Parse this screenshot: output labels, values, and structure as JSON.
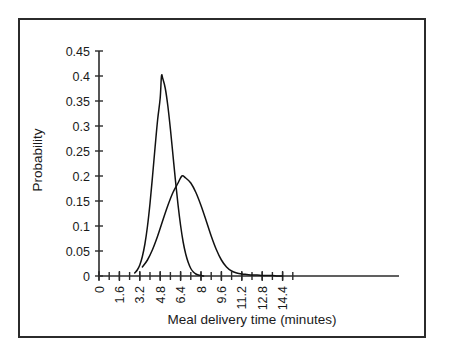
{
  "chart_data": {
    "type": "line",
    "title": "",
    "xlabel": "Meal delivery time (minutes)",
    "ylabel": "Probability",
    "xlim": [
      0,
      15.2
    ],
    "ylim": [
      0,
      0.45
    ],
    "grid": false,
    "legend": "none",
    "x_tick_labels": [
      "0",
      "1.6",
      "3.2",
      "4.8",
      "6.4",
      "8",
      "9.6",
      "11.2",
      "12.8",
      "14.4"
    ],
    "x_tick_values": [
      0,
      1.6,
      3.2,
      4.8,
      6.4,
      8,
      9.6,
      11.2,
      12.8,
      14.4
    ],
    "x_minor_step": 0.8,
    "y_tick_labels": [
      "0",
      "0.05",
      "0.1",
      "0.15",
      "0.2",
      "0.25",
      "0.3",
      "0.35",
      "0.4",
      "0.45"
    ],
    "y_tick_values": [
      0,
      0.05,
      0.1,
      0.15,
      0.2,
      0.25,
      0.3,
      0.35,
      0.4,
      0.45
    ],
    "series": [
      {
        "name": "narrow-distribution",
        "peak_x": 4.9,
        "peak_y": 0.4,
        "mean": 4.9,
        "std": 1.0,
        "x": [
          2.8,
          3.0,
          3.2,
          3.4,
          3.6,
          3.8,
          4.0,
          4.2,
          4.4,
          4.6,
          4.8,
          4.9,
          5.0,
          5.2,
          5.4,
          5.6,
          5.8,
          6.0,
          6.2,
          6.4,
          6.6,
          6.8,
          7.0,
          7.2,
          7.4,
          7.6,
          7.8,
          8.0,
          8.2
        ],
        "values": [
          0.006,
          0.012,
          0.022,
          0.039,
          0.064,
          0.099,
          0.145,
          0.2,
          0.258,
          0.313,
          0.356,
          0.4,
          0.395,
          0.375,
          0.34,
          0.294,
          0.242,
          0.19,
          0.142,
          0.101,
          0.068,
          0.044,
          0.027,
          0.015,
          0.008,
          0.004,
          0.002,
          0.001,
          0.0
        ]
      },
      {
        "name": "wide-distribution",
        "peak_x": 6.5,
        "peak_y": 0.2,
        "mean": 6.5,
        "std": 2.0,
        "x": [
          3.4,
          3.8,
          4.2,
          4.6,
          5.0,
          5.4,
          5.8,
          6.2,
          6.5,
          6.8,
          7.2,
          7.6,
          8.0,
          8.4,
          8.8,
          9.2,
          9.6,
          10.0,
          10.4,
          10.8,
          11.2,
          11.6,
          12.0,
          12.4,
          12.8,
          13.2,
          13.6,
          14.0,
          14.4
        ],
        "values": [
          0.018,
          0.032,
          0.053,
          0.08,
          0.111,
          0.141,
          0.167,
          0.186,
          0.2,
          0.196,
          0.186,
          0.167,
          0.141,
          0.111,
          0.08,
          0.053,
          0.032,
          0.018,
          0.01,
          0.006,
          0.004,
          0.003,
          0.002,
          0.002,
          0.001,
          0.001,
          0.001,
          0.0,
          0.0
        ]
      }
    ],
    "colors": {
      "curve": "#111111",
      "axis": "#2b2b2b",
      "text": "#1a1a1a",
      "background": "#ffffff",
      "frame": "#2b2b2b"
    }
  }
}
